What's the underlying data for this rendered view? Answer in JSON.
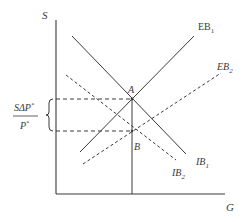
{
  "diagram": {
    "axes": {
      "y_label": "S",
      "x_label": "G"
    },
    "points": {
      "A": {
        "label": "A"
      },
      "B": {
        "label": "B"
      }
    },
    "curves": [
      {
        "id": "EB1",
        "label_main": "EB",
        "label_sub": "1",
        "style": "solid"
      },
      {
        "id": "IB1",
        "label_main": "IB",
        "label_sub": "1",
        "style": "solid"
      },
      {
        "id": "EB2",
        "label_main": "EB",
        "label_sub": "2",
        "style": "dashed"
      },
      {
        "id": "IB2",
        "label_main": "IB",
        "label_sub": "2",
        "style": "dashed"
      }
    ],
    "brace_label": {
      "numerator": "SΔP",
      "numerator_sup": "*",
      "denominator": "P",
      "denominator_sup": "*"
    },
    "colors": {
      "line": "#3a3a3a",
      "background": "#ffffff"
    }
  }
}
